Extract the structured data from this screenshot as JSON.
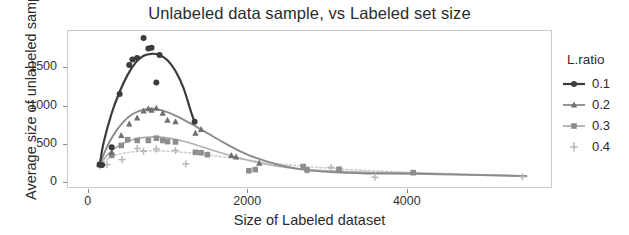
{
  "chart_data": {
    "type": "scatter",
    "title": "Unlabeled data sample, vs Labeled set size",
    "xlabel": "Size of Labeled dataset",
    "ylabel": "Average size of unlabeled sample",
    "xlim": [
      -260,
      5820
    ],
    "ylim": [
      -75,
      1985
    ],
    "xticks": [
      0,
      2000,
      4000
    ],
    "xtick_labels": [
      "0",
      "2000",
      "4000"
    ],
    "yticks": [
      0,
      500,
      1000,
      1500
    ],
    "ytick_labels": [
      "0",
      "500",
      "1000",
      "1500"
    ],
    "grid": false,
    "legend_position": "right",
    "legend_title": "L.ratio",
    "series": [
      {
        "name": "0.1",
        "label": "0.1",
        "marker": "circle",
        "color": "#3b3b3b",
        "line_color": "#3b3b3b",
        "points": [
          [
            150,
            230
          ],
          [
            180,
            225
          ],
          [
            300,
            455
          ],
          [
            400,
            1150
          ],
          [
            520,
            1530
          ],
          [
            560,
            1600
          ],
          [
            620,
            1620
          ],
          [
            700,
            1880
          ],
          [
            760,
            1745
          ],
          [
            800,
            1755
          ],
          [
            860,
            1300
          ],
          [
            900,
            1660
          ],
          [
            1340,
            790
          ]
        ],
        "curve": [
          [
            150,
            225
          ],
          [
            200,
            520
          ],
          [
            300,
            900
          ],
          [
            400,
            1180
          ],
          [
            500,
            1400
          ],
          [
            600,
            1560
          ],
          [
            700,
            1650
          ],
          [
            800,
            1675
          ],
          [
            900,
            1660
          ],
          [
            1000,
            1590
          ],
          [
            1100,
            1450
          ],
          [
            1200,
            1230
          ],
          [
            1300,
            900
          ],
          [
            1340,
            790
          ]
        ]
      },
      {
        "name": "0.2",
        "label": "0.2",
        "marker": "triangle",
        "color": "#6f6f6f",
        "line_color": "#8a8a8a",
        "points": [
          [
            150,
            228
          ],
          [
            300,
            390
          ],
          [
            420,
            610
          ],
          [
            520,
            760
          ],
          [
            620,
            840
          ],
          [
            700,
            930
          ],
          [
            760,
            960
          ],
          [
            800,
            940
          ],
          [
            860,
            965
          ],
          [
            940,
            900
          ],
          [
            1000,
            810
          ],
          [
            1100,
            790
          ],
          [
            1350,
            640
          ],
          [
            1420,
            690
          ],
          [
            1800,
            350
          ],
          [
            1860,
            330
          ],
          [
            2150,
            250
          ]
        ],
        "curve": [
          [
            150,
            228
          ],
          [
            250,
            480
          ],
          [
            350,
            660
          ],
          [
            450,
            790
          ],
          [
            550,
            880
          ],
          [
            650,
            930
          ],
          [
            750,
            955
          ],
          [
            850,
            955
          ],
          [
            950,
            930
          ],
          [
            1100,
            870
          ],
          [
            1300,
            760
          ],
          [
            1500,
            640
          ],
          [
            1700,
            520
          ],
          [
            1900,
            410
          ],
          [
            2100,
            320
          ],
          [
            2400,
            225
          ],
          [
            2700,
            165
          ],
          [
            3000,
            135
          ],
          [
            3500,
            115
          ],
          [
            4100,
            110
          ],
          [
            5500,
            80
          ]
        ]
      },
      {
        "name": "0.3",
        "label": "0.3",
        "marker": "square",
        "color": "#8d8d8d",
        "line_color": "#b0b0b0",
        "points": [
          [
            150,
            230
          ],
          [
            300,
            350
          ],
          [
            420,
            480
          ],
          [
            500,
            555
          ],
          [
            620,
            545
          ],
          [
            760,
            545
          ],
          [
            860,
            575
          ],
          [
            940,
            545
          ],
          [
            1000,
            530
          ],
          [
            1100,
            525
          ],
          [
            1350,
            390
          ],
          [
            1420,
            385
          ],
          [
            1500,
            360
          ],
          [
            2020,
            150
          ],
          [
            2100,
            165
          ],
          [
            2700,
            205
          ],
          [
            2750,
            160
          ],
          [
            3150,
            170
          ],
          [
            4080,
            125
          ]
        ],
        "curve": [
          [
            150,
            230
          ],
          [
            250,
            360
          ],
          [
            350,
            450
          ],
          [
            450,
            510
          ],
          [
            550,
            550
          ],
          [
            650,
            575
          ],
          [
            750,
            588
          ],
          [
            850,
            592
          ],
          [
            950,
            585
          ],
          [
            1100,
            560
          ],
          [
            1300,
            505
          ],
          [
            1500,
            440
          ],
          [
            1700,
            375
          ],
          [
            1900,
            315
          ],
          [
            2100,
            265
          ],
          [
            2400,
            205
          ],
          [
            2700,
            170
          ],
          [
            3100,
            145
          ],
          [
            3600,
            128
          ],
          [
            4100,
            120
          ],
          [
            5500,
            80
          ]
        ]
      },
      {
        "name": "0.4",
        "label": "0.4",
        "marker": "plus",
        "color": "#b8b8b8",
        "line_color": "#cfcfcf",
        "points": [
          [
            150,
            215
          ],
          [
            240,
            230
          ],
          [
            430,
            295
          ],
          [
            620,
            440
          ],
          [
            700,
            405
          ],
          [
            860,
            435
          ],
          [
            1100,
            415
          ],
          [
            1230,
            240
          ],
          [
            2750,
            160
          ],
          [
            3050,
            195
          ],
          [
            3600,
            65
          ],
          [
            5450,
            70
          ]
        ],
        "curve": [
          [
            150,
            225
          ],
          [
            300,
            330
          ],
          [
            450,
            380
          ],
          [
            600,
            400
          ],
          [
            750,
            410
          ],
          [
            900,
            408
          ],
          [
            1100,
            398
          ],
          [
            1400,
            370
          ],
          [
            1700,
            330
          ],
          [
            2000,
            290
          ],
          [
            2400,
            240
          ],
          [
            2800,
            200
          ],
          [
            3300,
            165
          ],
          [
            3900,
            135
          ],
          [
            4600,
            110
          ],
          [
            5500,
            85
          ]
        ]
      }
    ]
  },
  "legend": {
    "title": "L.ratio",
    "items": [
      {
        "label": "0.1",
        "marker": "circle"
      },
      {
        "label": "0.2",
        "marker": "triangle"
      },
      {
        "label": "0.3",
        "marker": "square"
      },
      {
        "label": "0.4",
        "marker": "plus"
      }
    ]
  }
}
